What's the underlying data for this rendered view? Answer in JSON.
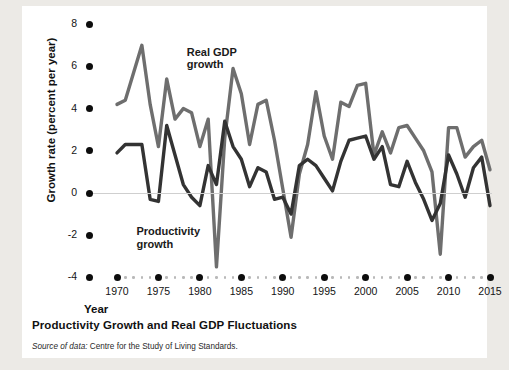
{
  "figure": {
    "caption": "Productivity Growth and Real GDP Fluctuations",
    "source_prefix": "Source of data:",
    "source_text": "Centre for the Study of Living Standards."
  },
  "chart_data": {
    "type": "line",
    "title": "Productivity Growth and Real GDP Fluctuations",
    "xlabel": "Year",
    "ylabel": "Growth rate (percent per year)",
    "xlim": [
      1969,
      2016
    ],
    "ylim": [
      -4,
      8
    ],
    "yticks": [
      8,
      6,
      4,
      2,
      0,
      -2,
      -4
    ],
    "ytick_labels": [
      "8",
      "6",
      "4",
      "2",
      "0",
      "-2",
      "-4"
    ],
    "xticks": [
      1970,
      1975,
      1980,
      1985,
      1990,
      1995,
      2000,
      2005,
      2010,
      2015
    ],
    "xtick_labels": [
      "1970",
      "1975",
      "1980",
      "1985",
      "1990",
      "1995",
      "2000",
      "2005",
      "2010",
      "2015"
    ],
    "grid": false,
    "zero_line": true,
    "legend_position": "inline-annotations",
    "annotations": [
      {
        "text": "Real GDP\ngrowth",
        "line1": "Real GDP",
        "line2": "growth",
        "x": 1983,
        "y": 6.6
      },
      {
        "text": "Productivity\ngrowth",
        "line1": "Productivity",
        "line2": "growth",
        "x": 1975,
        "y": -1.9
      }
    ],
    "x": [
      1970,
      1971,
      1972,
      1973,
      1974,
      1975,
      1976,
      1977,
      1978,
      1979,
      1980,
      1981,
      1982,
      1983,
      1984,
      1985,
      1986,
      1987,
      1988,
      1989,
      1990,
      1991,
      1992,
      1993,
      1994,
      1995,
      1996,
      1997,
      1998,
      1999,
      2000,
      2001,
      2002,
      2003,
      2004,
      2005,
      2006,
      2007,
      2008,
      2009,
      2010,
      2011,
      2012,
      2013,
      2014,
      2015
    ],
    "series": [
      {
        "name": "Real GDP growth",
        "color": "#6e6e6e",
        "values": [
          4.2,
          4.4,
          5.7,
          7.0,
          4.2,
          2.2,
          5.4,
          3.5,
          4.0,
          3.8,
          2.2,
          3.5,
          -3.5,
          2.6,
          5.9,
          4.7,
          2.3,
          4.2,
          4.4,
          2.5,
          0.2,
          -2.1,
          0.9,
          2.3,
          4.8,
          2.7,
          1.6,
          4.3,
          4.1,
          5.1,
          5.2,
          1.8,
          2.9,
          1.9,
          3.1,
          3.2,
          2.6,
          2.0,
          1.0,
          -2.9,
          3.1,
          3.1,
          1.7,
          2.2,
          2.5,
          1.1
        ]
      },
      {
        "name": "Productivity growth",
        "color": "#333333",
        "values": [
          1.9,
          2.3,
          2.3,
          2.3,
          -0.3,
          -0.4,
          3.2,
          1.8,
          0.4,
          -0.2,
          -0.6,
          1.3,
          0.4,
          3.4,
          2.2,
          1.6,
          0.3,
          1.2,
          1.0,
          -0.3,
          -0.2,
          -1.0,
          1.3,
          1.6,
          1.3,
          0.7,
          0.1,
          1.5,
          2.5,
          2.6,
          2.7,
          1.6,
          2.2,
          0.4,
          0.3,
          1.5,
          0.5,
          -0.3,
          -1.3,
          -0.5,
          1.8,
          0.9,
          -0.2,
          1.2,
          1.7,
          -0.6
        ]
      }
    ]
  }
}
